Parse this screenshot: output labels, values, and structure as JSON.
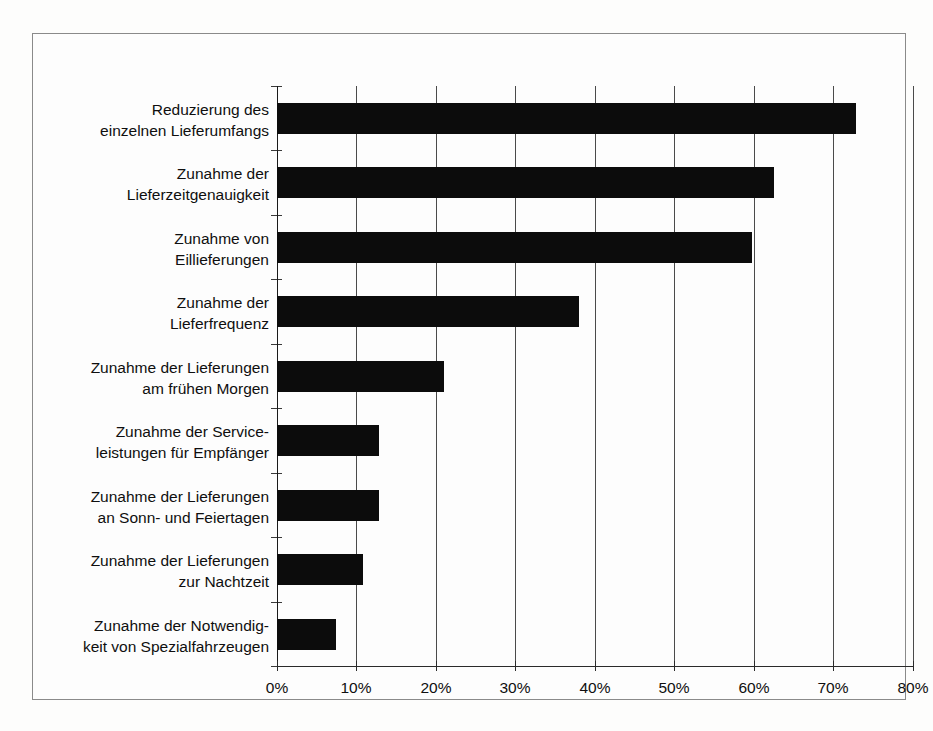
{
  "chart_data": {
    "type": "bar",
    "orientation": "horizontal",
    "title": "",
    "subtitle": "",
    "xlabel": "",
    "ylabel": "",
    "xlim": [
      0,
      80
    ],
    "xtick_labels": [
      "0%",
      "10%",
      "20%",
      "30%",
      "40%",
      "50%",
      "60%",
      "70%",
      "80%"
    ],
    "xtick_values": [
      0,
      10,
      20,
      30,
      40,
      50,
      60,
      70,
      80
    ],
    "grid": "vertical",
    "legend": "none",
    "bar_color": "#0c0c0c",
    "categories": [
      "Reduzierung des\neinzelnen Lieferumfangs",
      "Zunahme der\nLieferzeitgenauigkeit",
      "Zunahme von\nEillieferungen",
      "Zunahme der\nLieferfrequenz",
      "Zunahme der Lieferungen\nam frühen Morgen",
      "Zunahme der Service-\nleistungen für Empfänger",
      "Zunahme der Lieferungen\nan Sonn- und Feiertagen",
      "Zunahme der Lieferungen\nzur Nachtzeit",
      "Zunahme der Notwendig-\nkeit von Spezialfahrzeugen"
    ],
    "values": [
      72.8,
      62.5,
      59.8,
      38.0,
      21.0,
      12.8,
      12.8,
      10.8,
      7.4
    ]
  }
}
